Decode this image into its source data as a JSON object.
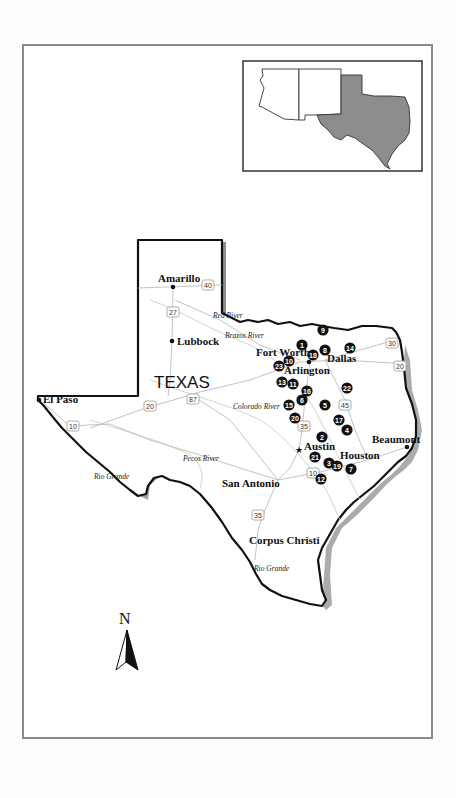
{
  "map": {
    "state_label": "TEXAS",
    "north_label": "N",
    "inset": {
      "highlight_color": "#8c8c8c",
      "states": [
        "Arizona",
        "New Mexico",
        "Texas"
      ]
    },
    "cities": [
      {
        "name": "Amarillo",
        "x": 173,
        "y": 287,
        "label_x": 158,
        "label_y": 282,
        "symbol": "dot"
      },
      {
        "name": "Lubbock",
        "x": 172,
        "y": 341,
        "label_x": 177,
        "label_y": 345,
        "symbol": "dot"
      },
      {
        "name": "Fort Worth",
        "x": 309,
        "y": 362,
        "label_x": 256,
        "label_y": 356,
        "symbol": "dot"
      },
      {
        "name": "Arlington",
        "x": 313,
        "y": 362,
        "label_x": 284,
        "label_y": 374,
        "symbol": "none"
      },
      {
        "name": "Dallas",
        "x": 322,
        "y": 360,
        "label_x": 327,
        "label_y": 362,
        "symbol": "none"
      },
      {
        "name": "El Paso",
        "x": 39,
        "y": 400,
        "label_x": 43,
        "label_y": 403,
        "symbol": "dot"
      },
      {
        "name": "Austin",
        "x": 299,
        "y": 450,
        "label_x": 304,
        "label_y": 450,
        "symbol": "star"
      },
      {
        "name": "Houston",
        "x": 368,
        "y": 460,
        "label_x": 340,
        "label_y": 459,
        "symbol": "none"
      },
      {
        "name": "Beaumont",
        "x": 407,
        "y": 447,
        "label_x": 372,
        "label_y": 443,
        "symbol": "dot"
      },
      {
        "name": "San Antonio",
        "x": 278,
        "y": 480,
        "label_x": 222,
        "label_y": 487,
        "symbol": "none"
      },
      {
        "name": "Corpus Christi",
        "x": 311,
        "y": 540,
        "label_x": 249,
        "label_y": 544,
        "symbol": "none"
      }
    ],
    "rivers": [
      {
        "name": "Red River",
        "x": 213,
        "y": 318
      },
      {
        "name": "Brazos River",
        "x": 225,
        "y": 338
      },
      {
        "name": "Colorado River",
        "x": 233,
        "y": 409
      },
      {
        "name": "Pecos River",
        "x": 183,
        "y": 461
      },
      {
        "name": "Rio Grande",
        "x": 94,
        "y": 479
      },
      {
        "name": "Rio Grande",
        "x": 254,
        "y": 571
      }
    ],
    "highways": [
      {
        "label": "40",
        "x": 208,
        "y": 285
      },
      {
        "label": "27",
        "x": 173,
        "y": 312
      },
      {
        "label": "20",
        "x": 150,
        "y": 406
      },
      {
        "label": "87",
        "x": 193,
        "y": 399
      },
      {
        "label": "10",
        "x": 73,
        "y": 426
      },
      {
        "label": "30",
        "x": 392,
        "y": 343
      },
      {
        "label": "20",
        "x": 400,
        "y": 366
      },
      {
        "label": "45",
        "x": 345,
        "y": 405
      },
      {
        "label": "35",
        "x": 304,
        "y": 426
      },
      {
        "label": "10",
        "x": 313,
        "y": 473
      },
      {
        "label": "35",
        "x": 258,
        "y": 515
      }
    ],
    "markers": [
      {
        "label": "1",
        "x": 302,
        "y": 345
      },
      {
        "label": "2",
        "x": 322,
        "y": 437
      },
      {
        "label": "3",
        "x": 329,
        "y": 463
      },
      {
        "label": "4",
        "x": 347,
        "y": 430
      },
      {
        "label": "5",
        "x": 325,
        "y": 405
      },
      {
        "label": "6",
        "x": 302,
        "y": 400
      },
      {
        "label": "7",
        "x": 351,
        "y": 469
      },
      {
        "label": "8",
        "x": 325,
        "y": 350
      },
      {
        "label": "9",
        "x": 323,
        "y": 330
      },
      {
        "label": "10",
        "x": 289,
        "y": 361
      },
      {
        "label": "11",
        "x": 293,
        "y": 384
      },
      {
        "label": "12",
        "x": 321,
        "y": 479
      },
      {
        "label": "13",
        "x": 282,
        "y": 382
      },
      {
        "label": "14",
        "x": 350,
        "y": 348
      },
      {
        "label": "15",
        "x": 289,
        "y": 405
      },
      {
        "label": "16",
        "x": 307,
        "y": 391
      },
      {
        "label": "17",
        "x": 339,
        "y": 420
      },
      {
        "label": "18",
        "x": 313,
        "y": 355
      },
      {
        "label": "19",
        "x": 337,
        "y": 466
      },
      {
        "label": "20",
        "x": 295,
        "y": 418
      },
      {
        "label": "21",
        "x": 315,
        "y": 457
      },
      {
        "label": "22",
        "x": 347,
        "y": 388
      },
      {
        "label": "23",
        "x": 279,
        "y": 366
      }
    ]
  }
}
